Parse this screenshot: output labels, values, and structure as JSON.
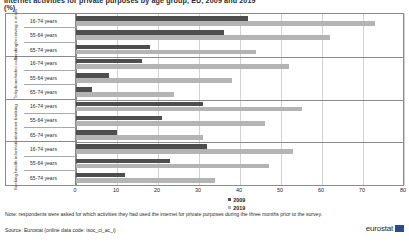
{
  "title": {
    "main": "Internet activities for private purposes by age group, EU, 2009 and 2019",
    "unit": "(%)"
  },
  "legend": {
    "position": "bottom-center",
    "items": [
      {
        "label": "2009",
        "color": "#4e4e4e"
      },
      {
        "label": "2019",
        "color": "#b4b4b4"
      }
    ]
  },
  "axis": {
    "x_ticks": [
      "0",
      "10",
      "20",
      "30",
      "40",
      "50",
      "60",
      "70",
      "80"
    ],
    "x_min": 0,
    "x_max": 80,
    "x_step": 10
  },
  "age_labels": {
    "all": "16-74 years",
    "older": "55-64 years",
    "oldest": "65-74 years"
  },
  "groups": [
    {
      "name": "Sending/receiving e-mails"
    },
    {
      "name": "Telephone/video calls"
    },
    {
      "name": "Internet banking"
    },
    {
      "name": "Seeking health information"
    }
  ],
  "footnotes": {
    "note": "Note: respondents were asked for which activities they had used the internet for private purposes during the three months prior to the survey.",
    "source": "Source: Eurostat (online data code: isoc_ci_ac_i)"
  },
  "branding": {
    "logo_text": "eurostat",
    "logo_color": "#2b4b8f"
  },
  "chart_data": {
    "type": "bar",
    "orientation": "horizontal",
    "title": "Internet activities for private purposes by age group, EU, 2009 and 2019",
    "xlabel": "(%)",
    "ylabel": "",
    "xlim": [
      0,
      80
    ],
    "grid": true,
    "legend_position": "bottom-center",
    "categories": [
      "Sending/receiving e-mails | 16-74 years",
      "Sending/receiving e-mails | 55-64 years",
      "Sending/receiving e-mails | 65-74 years",
      "Telephone/video calls | 16-74 years",
      "Telephone/video calls | 55-64 years",
      "Telephone/video calls | 65-74 years",
      "Internet banking | 16-74 years",
      "Internet banking | 55-64 years",
      "Internet banking | 65-74 years",
      "Seeking health information | 16-74 years",
      "Seeking health information | 55-64 years",
      "Seeking health information | 65-74 years"
    ],
    "series": [
      {
        "name": "2009",
        "color": "#4e4e4e",
        "values": [
          42,
          36,
          18,
          16,
          8,
          4,
          31,
          21,
          10,
          32,
          23,
          12
        ]
      },
      {
        "name": "2019",
        "color": "#b4b4b4",
        "values": [
          73,
          62,
          44,
          52,
          38,
          24,
          55,
          46,
          31,
          53,
          47,
          34
        ]
      }
    ]
  }
}
